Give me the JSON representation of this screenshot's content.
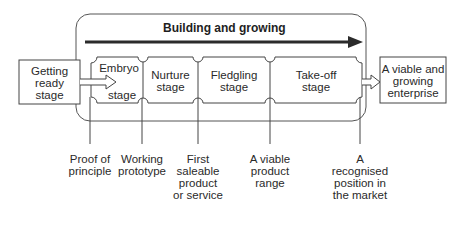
{
  "title": "Building and growing",
  "start_box": {
    "label": [
      "Getting",
      "ready",
      "stage"
    ]
  },
  "end_box": {
    "label": [
      "A viable and",
      "growing",
      "enterprise"
    ]
  },
  "stages": [
    {
      "name": "embryo",
      "line1": "Embryo",
      "line2": "stage"
    },
    {
      "name": "nurture",
      "line1": "Nurture",
      "line2": "stage"
    },
    {
      "name": "fledgling",
      "line1": "Fledgling",
      "line2": "stage"
    },
    {
      "name": "take-off",
      "line1": "Take-off",
      "line2": "stage"
    }
  ],
  "milestones": [
    {
      "name": "proof-of-principle",
      "lines": [
        "Proof of",
        "principle"
      ]
    },
    {
      "name": "working-prototype",
      "lines": [
        "Working",
        "prototype"
      ]
    },
    {
      "name": "first-saleable-product",
      "lines": [
        "First",
        "saleable",
        "product",
        "or service"
      ]
    },
    {
      "name": "viable-product-range",
      "lines": [
        "A viable",
        "product",
        "range"
      ]
    },
    {
      "name": "recognised-position",
      "lines": [
        "A",
        "recognised",
        "position in",
        "the market"
      ]
    }
  ],
  "colors": {
    "line": "#3a3a3a",
    "arrow": "#2b2b2b",
    "bg": "#ffffff"
  }
}
